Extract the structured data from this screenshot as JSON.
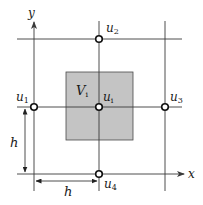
{
  "diagram": {
    "type": "finite-volume-grid-stencil",
    "colors": {
      "background": "#ffffff",
      "grid_line": "#3a3a3a",
      "control_volume_fill": "#c4c4c4",
      "control_volume_stroke": "#4a4a4a",
      "node_stroke": "#111111",
      "text": "#1a1a1a"
    },
    "axes": {
      "x_label": "x",
      "y_label": "y"
    },
    "control_volume": {
      "label_main": "V",
      "label_sub": "i"
    },
    "nodes": [
      {
        "id": "u1",
        "main": "u",
        "sub": "1",
        "position": "left"
      },
      {
        "id": "u2",
        "main": "u",
        "sub": "2",
        "position": "top"
      },
      {
        "id": "u3",
        "main": "u",
        "sub": "3",
        "position": "right"
      },
      {
        "id": "u4",
        "main": "u",
        "sub": "4",
        "position": "bottom"
      },
      {
        "id": "ui",
        "main": "u",
        "sub": "i",
        "position": "center"
      }
    ],
    "dimensions": {
      "vertical_spacing_label": "h",
      "horizontal_spacing_label": "h"
    }
  }
}
